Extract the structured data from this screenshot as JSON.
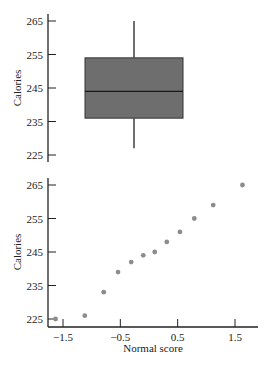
{
  "chart_data": [
    {
      "type": "box",
      "title": "",
      "xlabel": "",
      "ylabel": "Calories",
      "ylim": [
        225,
        265
      ],
      "yticks": [
        "265",
        "255",
        "245",
        "235",
        "225"
      ],
      "summary": {
        "min": 227,
        "q1": 236,
        "median": 244,
        "q3": 254,
        "max": 265
      },
      "box_color": "#6e6e6e"
    },
    {
      "type": "scatter",
      "title": "",
      "xlabel": "Normal score",
      "ylabel": "Calories",
      "ylim": [
        225,
        265
      ],
      "xlim": [
        -1.8,
        1.9
      ],
      "yticks": [
        "265",
        "255",
        "245",
        "235",
        "225"
      ],
      "xticks": [
        "−1.5",
        "−0.5",
        "0.5",
        "1.5"
      ],
      "grid": false,
      "point_color": "#8c8c8c",
      "x": [
        -1.63,
        -1.12,
        -0.79,
        -0.54,
        -0.31,
        -0.1,
        0.1,
        0.31,
        0.54,
        0.79,
        1.12,
        1.63
      ],
      "y": [
        225,
        226,
        233,
        239,
        242,
        244,
        245,
        248,
        251,
        255,
        259,
        265
      ]
    }
  ]
}
